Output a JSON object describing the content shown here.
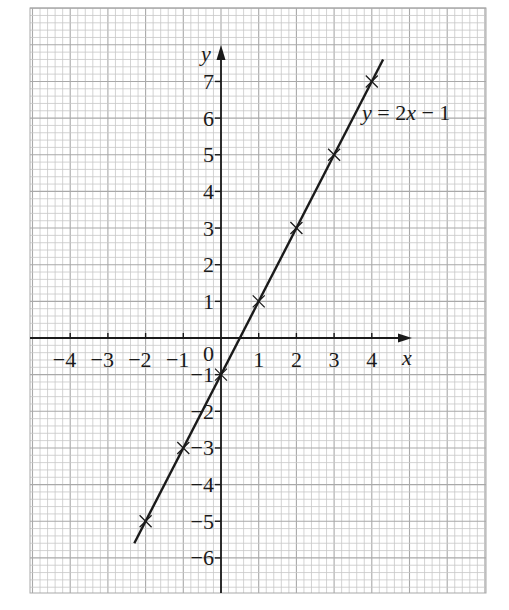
{
  "chart_data": {
    "type": "line",
    "title": "",
    "xlabel": "x",
    "ylabel": "y",
    "xlim": [
      -5,
      7
    ],
    "ylim": [
      -7,
      9
    ],
    "grid": true,
    "grid_minor_per_unit": 5,
    "x_ticks": [
      -4,
      -3,
      -2,
      -1,
      1,
      2,
      3,
      4
    ],
    "x_tick_labels": [
      "−4",
      "−3",
      "−2",
      "−1",
      "1",
      "2",
      "3",
      "4"
    ],
    "y_ticks": [
      -6,
      -5,
      -4,
      -3,
      -2,
      -1,
      1,
      2,
      3,
      4,
      5,
      6,
      7
    ],
    "y_tick_labels": [
      "−6",
      "−5",
      "−4",
      "−3",
      "−2",
      "−1",
      "1",
      "2",
      "3",
      "4",
      "5",
      "6",
      "7"
    ],
    "origin_label": "0",
    "series": [
      {
        "name": "y = 2x − 1",
        "equation": "y = 2x - 1",
        "line_extent_x": [
          -2.3,
          4.3
        ],
        "points": [
          {
            "x": -2,
            "y": -5
          },
          {
            "x": -1,
            "y": -3
          },
          {
            "x": 0,
            "y": -1
          },
          {
            "x": 1,
            "y": 1
          },
          {
            "x": 2,
            "y": 3
          },
          {
            "x": 3,
            "y": 5
          },
          {
            "x": 4,
            "y": 7
          }
        ],
        "marker": "x"
      }
    ],
    "annotations": [
      {
        "text": "y = 2x − 1",
        "x": 3.8,
        "y": 6.1
      }
    ]
  },
  "labels": {
    "x_axis": "x",
    "y_axis": "y",
    "origin": "0",
    "equation_y": "y",
    "equation_eq": " = 2",
    "equation_x": "x",
    "equation_rest": " − 1"
  },
  "colors": {
    "grid_minor": "#c8c8c8",
    "grid_major": "#a9a9a9",
    "ink": "#1a1a1a",
    "background": "#ffffff"
  }
}
